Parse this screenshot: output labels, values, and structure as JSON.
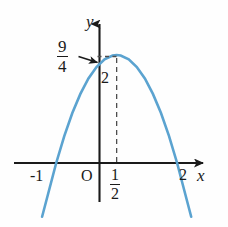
{
  "figure": {
    "kind": "coordinate-plane-parabola",
    "background_color": "#fefefe",
    "axis_color": "#1a1a1a",
    "curve_color": "#5ba3d0",
    "dashed_color": "#4d4d4d"
  },
  "labels": {
    "y_axis_name": "y",
    "x_axis_name": "x",
    "origin": "O",
    "x_tick_left": "-1",
    "x_tick_right": "2",
    "y_tick": "2",
    "vertex_x_numerator": "1",
    "vertex_x_denominator": "2",
    "vertex_y_numerator": "9",
    "vertex_y_denominator": "4"
  },
  "chart_data": {
    "type": "line",
    "title": "",
    "xlabel": "x",
    "ylabel": "y",
    "grid": false,
    "legend": null,
    "xlim": [
      -1.35,
      2.35
    ],
    "ylim": [
      -1.0,
      2.55
    ],
    "annotations": [
      {
        "text": "9/4",
        "kind": "vertex-height-callout",
        "points_to": [
          0.5,
          2.25
        ]
      },
      {
        "text": "2",
        "kind": "y-intercept-tick",
        "at": [
          0,
          2
        ]
      },
      {
        "text": "-1",
        "kind": "x-tick",
        "at": [
          -1,
          0
        ]
      },
      {
        "text": "2",
        "kind": "x-tick",
        "at": [
          2,
          0
        ]
      },
      {
        "text": "1/2",
        "kind": "x-tick-vertex",
        "at": [
          0.5,
          0
        ]
      },
      {
        "text": "O",
        "kind": "origin",
        "at": [
          0,
          0
        ]
      }
    ],
    "series": [
      {
        "name": "y = -(x+1)(x-2)",
        "roots": [
          -1,
          2
        ],
        "vertex": [
          0.5,
          2.25
        ],
        "y_intercept": 2,
        "opens": "down",
        "x": [
          -1.35,
          -1.2,
          -1.0,
          -0.8,
          -0.6,
          -0.4,
          -0.2,
          0.0,
          0.2,
          0.4,
          0.5,
          0.6,
          0.8,
          1.0,
          1.2,
          1.4,
          1.6,
          1.8,
          2.0,
          2.2,
          2.35
        ],
        "values": [
          -1.12,
          -0.64,
          0.0,
          0.56,
          1.04,
          1.44,
          1.76,
          2.0,
          2.16,
          2.24,
          2.25,
          2.24,
          2.16,
          2.0,
          1.76,
          1.44,
          1.04,
          0.56,
          0.0,
          -0.64,
          -1.12
        ]
      }
    ],
    "dashed_guides": [
      {
        "from": [
          0.5,
          0
        ],
        "to": [
          0.5,
          2.25
        ],
        "orientation": "vertical"
      },
      {
        "from": [
          0.0,
          2.25
        ],
        "to": [
          0.5,
          2.25
        ],
        "orientation": "horizontal"
      }
    ]
  }
}
